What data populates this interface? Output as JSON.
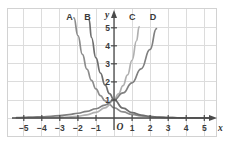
{
  "figure": {
    "background": "#ffffff",
    "grid_color": "#dcdcdc",
    "axis_color": "#4a4a4a",
    "border_color": "#d2d2d2"
  },
  "axes": {
    "x_label": "x",
    "y_label": "y",
    "origin_label": "O",
    "x_ticks": [
      "−5",
      "−4",
      "−3",
      "−2",
      "−1",
      "1",
      "2",
      "3",
      "4",
      "5"
    ],
    "y_ticks": [
      "1",
      "2",
      "3",
      "4",
      "5"
    ],
    "xlim": [
      -5.6,
      5.6
    ],
    "ylim": [
      -0.55,
      5.85
    ]
  },
  "curve_labels": [
    {
      "text": "A",
      "x": -2.45,
      "y": 5.62
    },
    {
      "text": "B",
      "x": -1.45,
      "y": 5.62
    },
    {
      "text": "C",
      "x": 1.02,
      "y": 5.62
    },
    {
      "text": "D",
      "x": 2.18,
      "y": 5.62
    }
  ],
  "chart_data": {
    "type": "line",
    "title": "",
    "xlabel": "x",
    "ylabel": "y",
    "xlim": [
      -5.6,
      5.6
    ],
    "ylim": [
      -0.55,
      5.85
    ],
    "grid": true,
    "legend": "inline-curve-labels",
    "series": [
      {
        "name": "A",
        "color": "#8c8c8c",
        "base": 0.45,
        "equation": "y = 0.45^x",
        "x": [
          -2.22,
          -2.0,
          -1.75,
          -1.5,
          -1.25,
          -1.0,
          -0.75,
          -0.5,
          -0.25,
          0,
          0.5,
          1.0,
          1.5,
          2.0,
          2.5,
          3.0,
          3.5,
          4.0,
          4.5,
          5.0,
          5.4
        ],
        "y": [
          5.55,
          4.57,
          3.52,
          2.71,
          2.09,
          1.61,
          1.24,
          0.956,
          0.736,
          0.567,
          0.337,
          0.2,
          0.119,
          0.0707,
          0.042,
          0.0249,
          0.0148,
          0.0088,
          0.0052,
          0.0031,
          0.002
        ]
      },
      {
        "name": "B",
        "color": "#6e6e6e",
        "base": 0.3,
        "equation": "y = 0.3^x",
        "x": [
          -1.38,
          -1.25,
          -1.0,
          -0.75,
          -0.5,
          -0.25,
          0,
          0.5,
          1.0,
          1.5,
          2.0,
          2.5,
          3.0,
          3.5,
          4.0,
          4.5,
          5.0,
          5.4
        ],
        "y": [
          5.45,
          4.46,
          3.33,
          2.49,
          1.83,
          1.35,
          1.0,
          0.548,
          0.3,
          0.164,
          0.09,
          0.049,
          0.027,
          0.0148,
          0.0081,
          0.0044,
          0.0024,
          0.0015
        ]
      },
      {
        "name": "C",
        "color": "#b0b0b0",
        "base": 3.2,
        "equation": "y = 3.2^x",
        "x": [
          -5.4,
          -5.0,
          -4.5,
          -4.0,
          -3.5,
          -3.0,
          -2.5,
          -2.0,
          -1.5,
          -1.0,
          -0.5,
          0,
          0.25,
          0.5,
          0.75,
          1.0,
          1.25,
          1.39
        ],
        "y": [
          0.0013,
          0.0019,
          0.0034,
          0.0095,
          0.017,
          0.0305,
          0.0546,
          0.0977,
          0.1747,
          0.3125,
          0.559,
          1.0,
          1.337,
          1.789,
          2.393,
          3.2,
          4.28,
          5.05
        ]
      },
      {
        "name": "D",
        "color": "#808080",
        "base": 1.95,
        "equation": "y = 1.95^x",
        "x": [
          -5.4,
          -5.0,
          -4.5,
          -4.0,
          -3.5,
          -3.0,
          -2.5,
          -2.0,
          -1.5,
          -1.0,
          -0.5,
          0,
          0.5,
          1.0,
          1.5,
          2.0,
          2.35
        ],
        "y": [
          0.0165,
          0.0356,
          0.0563,
          0.0692,
          0.0966,
          0.1349,
          0.1884,
          0.263,
          0.3672,
          0.5128,
          0.716,
          1.0,
          1.396,
          1.95,
          2.723,
          3.8,
          4.95
        ]
      }
    ]
  }
}
